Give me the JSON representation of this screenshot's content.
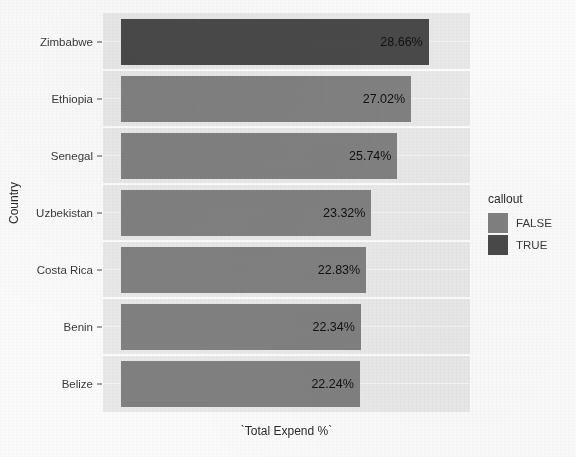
{
  "chart_data": {
    "type": "bar",
    "orientation": "horizontal",
    "title": "",
    "xlabel": "`Total Expend %`",
    "ylabel": "Country",
    "categories": [
      "Zimbabwe",
      "Ethiopia",
      "Senegal",
      "Uzbekistan",
      "Costa Rica",
      "Benin",
      "Belize"
    ],
    "values": [
      28.66,
      27.02,
      25.74,
      23.32,
      22.83,
      22.34,
      22.24
    ],
    "value_labels": [
      "28.66%",
      "27.02%",
      "25.74%",
      "23.32%",
      "22.83%",
      "22.34%",
      "22.24%"
    ],
    "series": [
      {
        "name": "`Total Expend %`",
        "values": [
          28.66,
          27.02,
          25.74,
          23.32,
          22.83,
          22.34,
          22.24
        ]
      }
    ],
    "callout_flags": [
      true,
      false,
      false,
      false,
      false,
      false,
      false
    ],
    "xlim": [
      0,
      32.5
    ],
    "ylim_categories": 7,
    "grid": true,
    "grid_orientation": "horizontal",
    "legend": {
      "title": "callout",
      "position": "right",
      "entries": [
        {
          "label": "FALSE",
          "color": "#828282"
        },
        {
          "label": "TRUE",
          "color": "#4a4a4a"
        }
      ]
    }
  },
  "colors": {
    "bar_false": "#828282",
    "bar_true": "#4a4a4a",
    "panel_background": "#ebebeb",
    "gridline": "#ffffff",
    "axis_text": "#3a3a3a",
    "page_background": "#fcfcfc"
  },
  "ghost_text": {
    "line1": "notes from the scanned document",
    "line2": "bleed-through artifact text",
    "line3": "faint reversed heading",
    "line4": "second line",
    "line5": "light speckle",
    "line6": "paper grain"
  }
}
